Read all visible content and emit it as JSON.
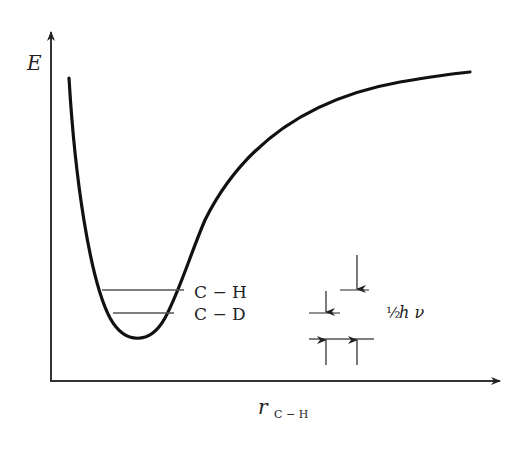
{
  "diagram": {
    "type": "potential-energy-curve",
    "y_axis_label": "E",
    "x_axis_label": "r",
    "x_axis_subscript": "C − H",
    "levels": [
      {
        "name": "C − H",
        "label": "C − H"
      },
      {
        "name": "C − D",
        "label": "C − D"
      }
    ],
    "zero_point_annotation": {
      "fraction": "½",
      "symbol": "h ν"
    },
    "colors": {
      "curve": "#111111",
      "axes": "#333333",
      "levels": "#555555",
      "text": "#222222"
    }
  }
}
